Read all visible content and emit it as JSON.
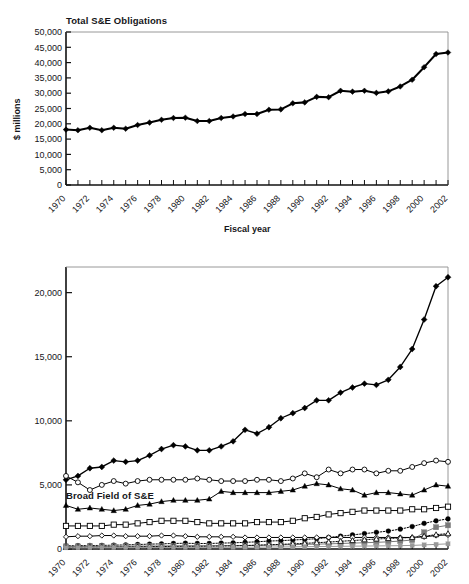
{
  "figure": {
    "background": "#ffffff",
    "foreground": "#16161a"
  },
  "chart_data": [
    {
      "id": "total-se-obligations",
      "type": "line",
      "title": "Total S&E Obligations",
      "xlabel": "Fiscal year",
      "ylabel": "$ millions",
      "xlim": [
        1970,
        2002
      ],
      "ylim": [
        0,
        50000
      ],
      "ytick_labels": [
        "0",
        "5,000",
        "10,000",
        "15,000",
        "20,000",
        "25,000",
        "30,000",
        "35,000",
        "40,000",
        "45,000",
        "50,000"
      ],
      "ytick_values": [
        0,
        5000,
        10000,
        15000,
        20000,
        25000,
        30000,
        35000,
        40000,
        45000,
        50000
      ],
      "xtick_labels": [
        "1970",
        "1972",
        "1974",
        "1976",
        "1978",
        "1980",
        "1982",
        "1984",
        "1986",
        "1988",
        "1990",
        "1992",
        "1994",
        "1996",
        "1998",
        "2000",
        "2002"
      ],
      "xtick_values": [
        1970,
        1972,
        1974,
        1976,
        1978,
        1980,
        1982,
        1984,
        1986,
        1988,
        1990,
        1992,
        1994,
        1996,
        1998,
        2000,
        2002
      ],
      "grid": false,
      "legend": "none",
      "x": [
        1970,
        1971,
        1972,
        1973,
        1974,
        1975,
        1976,
        1977,
        1978,
        1979,
        1980,
        1981,
        1982,
        1983,
        1984,
        1985,
        1986,
        1987,
        1988,
        1989,
        1990,
        1991,
        1992,
        1993,
        1994,
        1995,
        1996,
        1997,
        1998,
        1999,
        2000,
        2001,
        2002
      ],
      "series": [
        {
          "name": "Total S&E obligations",
          "marker": "filled-diamond",
          "color": "#000000",
          "values": [
            18100,
            17900,
            18700,
            17900,
            18700,
            18400,
            19600,
            20400,
            21300,
            21900,
            22000,
            20900,
            20900,
            21900,
            22400,
            23200,
            23200,
            24600,
            24700,
            26700,
            27000,
            28800,
            28700,
            30800,
            30500,
            30800,
            30100,
            30600,
            32200,
            34400,
            38500,
            42800,
            43300
          ]
        }
      ]
    },
    {
      "id": "broad-field-of-se",
      "type": "line",
      "title": "Broad Field of S&E",
      "xlabel": "",
      "ylabel": "$ millions",
      "xlim": [
        1970,
        2002
      ],
      "ylim": [
        0,
        22000
      ],
      "ytick_labels": [
        "0",
        "5,000",
        "10,000",
        "15,000",
        "20,000"
      ],
      "ytick_values": [
        0,
        5000,
        10000,
        15000,
        20000
      ],
      "xtick_labels": [
        "1970",
        "1972",
        "1974",
        "1976",
        "1978",
        "1980",
        "1982",
        "1984",
        "1986",
        "1988",
        "1990",
        "1992",
        "1994",
        "1996",
        "1998",
        "2000",
        "2002"
      ],
      "xtick_values": [
        1970,
        1972,
        1974,
        1976,
        1978,
        1980,
        1982,
        1984,
        1986,
        1988,
        1990,
        1992,
        1994,
        1996,
        1998,
        2000,
        2002
      ],
      "grid": false,
      "legend": "none",
      "x": [
        1970,
        1971,
        1972,
        1973,
        1974,
        1975,
        1976,
        1977,
        1978,
        1979,
        1980,
        1981,
        1982,
        1983,
        1984,
        1985,
        1986,
        1987,
        1988,
        1989,
        1990,
        1991,
        1992,
        1993,
        1994,
        1995,
        1996,
        1997,
        1998,
        1999,
        2000,
        2001,
        2002
      ],
      "series": [
        {
          "name": "Life sciences",
          "marker": "filled-diamond",
          "color": "#000000",
          "linestyle": "solid",
          "values": [
            5400,
            5700,
            6300,
            6400,
            6900,
            6800,
            6900,
            7300,
            7800,
            8100,
            8000,
            7700,
            7700,
            8000,
            8400,
            9300,
            9000,
            9500,
            10200,
            10600,
            11000,
            11600,
            11600,
            12200,
            12600,
            12900,
            12800,
            13200,
            14200,
            15600,
            17900,
            20500,
            21200
          ]
        },
        {
          "name": "Open-circle series",
          "marker": "open-circle",
          "color": "#000000",
          "linestyle": "solid",
          "values": [
            5700,
            5200,
            4600,
            5000,
            5300,
            5100,
            5300,
            5400,
            5400,
            5400,
            5400,
            5500,
            5400,
            5300,
            5300,
            5300,
            5400,
            5400,
            5300,
            5500,
            5900,
            5600,
            6200,
            5900,
            6200,
            6200,
            5900,
            6100,
            6100,
            6400,
            6700,
            6900,
            6800
          ]
        },
        {
          "name": "Filled-triangle series",
          "marker": "filled-triangle",
          "color": "#000000",
          "linestyle": "solid",
          "values": [
            3400,
            3100,
            3200,
            3100,
            3000,
            3100,
            3400,
            3500,
            3700,
            3800,
            3800,
            3800,
            3900,
            4500,
            4400,
            4400,
            4400,
            4400,
            4500,
            4600,
            4900,
            5100,
            5000,
            4700,
            4600,
            4200,
            4400,
            4400,
            4300,
            4200,
            4600,
            5000,
            4900
          ]
        },
        {
          "name": "Open-square series",
          "marker": "open-square",
          "color": "#000000",
          "linestyle": "solid",
          "values": [
            1800,
            1800,
            1800,
            1800,
            1900,
            1900,
            2000,
            2100,
            2200,
            2200,
            2200,
            2100,
            2000,
            2000,
            2000,
            2000,
            2100,
            2100,
            2100,
            2200,
            2400,
            2500,
            2700,
            2800,
            2900,
            3000,
            3000,
            3000,
            3000,
            3100,
            3100,
            3200,
            3300
          ]
        },
        {
          "name": "Filled-circle dotted series",
          "marker": "filled-circle",
          "color": "#000000",
          "linestyle": "dotted",
          "values": [
            250,
            260,
            270,
            280,
            300,
            320,
            350,
            380,
            400,
            430,
            450,
            430,
            430,
            460,
            480,
            520,
            560,
            620,
            650,
            700,
            750,
            800,
            900,
            1000,
            1100,
            1200,
            1300,
            1400,
            1550,
            1750,
            2000,
            2200,
            2350
          ]
        },
        {
          "name": "Open-diamond series",
          "marker": "open-diamond",
          "color": "#000000",
          "linestyle": "solid",
          "values": [
            950,
            1000,
            1000,
            1050,
            1050,
            1000,
            1000,
            1000,
            1050,
            1050,
            1000,
            950,
            950,
            950,
            950,
            900,
            900,
            900,
            900,
            900,
            900,
            900,
            900,
            900,
            900,
            900,
            900,
            900,
            900,
            900,
            950,
            1050,
            1100
          ]
        },
        {
          "name": "Filled-square gray series",
          "marker": "filled-square",
          "color": "#7a7a7a",
          "linestyle": "solid",
          "values": [
            200,
            200,
            210,
            210,
            220,
            220,
            230,
            230,
            240,
            250,
            250,
            250,
            250,
            260,
            260,
            270,
            280,
            300,
            320,
            340,
            360,
            380,
            400,
            430,
            460,
            490,
            520,
            560,
            620,
            700,
            1300,
            1700,
            1850
          ]
        },
        {
          "name": "Open-triangle dotted series",
          "marker": "open-triangle",
          "color": "#000000",
          "linestyle": "dotted",
          "values": [
            120,
            130,
            135,
            140,
            150,
            160,
            170,
            180,
            190,
            200,
            210,
            210,
            220,
            230,
            250,
            270,
            300,
            330,
            360,
            400,
            440,
            490,
            540,
            600,
            660,
            720,
            780,
            820,
            860,
            900,
            1000,
            1120,
            1200
          ]
        },
        {
          "name": "Baseline gray series",
          "marker": "small-filled-square",
          "color": "#999999",
          "linestyle": "solid",
          "values": [
            100,
            100,
            105,
            105,
            110,
            110,
            115,
            115,
            120,
            125,
            125,
            125,
            130,
            130,
            135,
            140,
            145,
            150,
            160,
            170,
            180,
            190,
            200,
            210,
            220,
            230,
            240,
            250,
            260,
            280,
            320,
            360,
            400
          ]
        }
      ]
    }
  ]
}
